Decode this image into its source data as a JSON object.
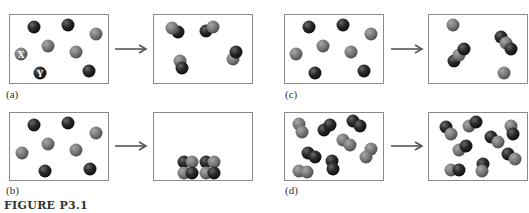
{
  "figure": {
    "caption": "FIGURE P3.1",
    "atom_legend": {
      "X": "X",
      "Y": "Y"
    },
    "colors": {
      "atom_x": "#7a7a7a",
      "atom_y": "#2a2a2a",
      "border": "#8a8a8a",
      "arrow": "#555555"
    },
    "panels": [
      {
        "id": "a",
        "label": "(a)",
        "before": "8 separate atoms: 4 X (gray), 4 Y (dark)",
        "after": "4 XY diatomic molecules"
      },
      {
        "id": "b",
        "label": "(b)",
        "before": "8 separate atoms: 4 X (gray), 4 Y (dark)",
        "after": "solid lattice of alternating X and Y at bottom"
      },
      {
        "id": "c",
        "label": "(c)",
        "before": "8 separate atoms: 4 X (gray), 4 Y (dark)",
        "after": "2 YXY triatomic molecules and 2 X atoms"
      },
      {
        "id": "d",
        "label": "(d)",
        "before": "X2 and Y2 diatomic molecules (8 molecules)",
        "after": "8 XY diatomic molecules"
      }
    ]
  }
}
